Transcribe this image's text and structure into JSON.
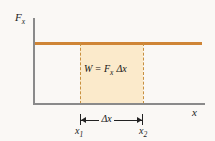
{
  "figure": {
    "axes": {
      "y_label": "F",
      "y_label_sub": "x",
      "x_label": "x"
    },
    "annotations": {
      "equation_w": "W",
      "equation_eq": "=",
      "equation_f": "F",
      "equation_f_sub": "x",
      "equation_delta_x": "Δx",
      "interval_label": "Δx",
      "tick_x1": "x",
      "tick_x1_sub": "1",
      "tick_x2": "x",
      "tick_x2_sub": "2"
    },
    "colors": {
      "force_line": "#cf8536",
      "shaded_region": "#fbeacb",
      "dashed_boundary": "#c8903f",
      "axis": "#8a8a8a",
      "background": "#faf8f5",
      "text": "#151515"
    }
  },
  "chart_data": {
    "type": "area",
    "xlabel": "x",
    "ylabel": "F_x",
    "grid": false,
    "legend": null,
    "xlim": [
      0,
      10
    ],
    "ylim": [
      0,
      10
    ],
    "series": [
      {
        "name": "F_x (constant force)",
        "x": [
          0,
          10
        ],
        "values": [
          7.1,
          7.1
        ],
        "color": "#cf8536"
      }
    ],
    "shaded_area": {
      "label": "W = F_x Δx",
      "x_start": 2.75,
      "x_end": 6.4,
      "y_top": 7.1,
      "y_bottom": 0,
      "color": "#fbeacb"
    },
    "annotations": [
      {
        "text": "W = F_x Δx",
        "x": 4.6,
        "y": 4.5
      },
      {
        "text": "Δx",
        "x": 4.6,
        "y": -0.9
      },
      {
        "text": "x_1",
        "x": 2.75,
        "y": -1.7
      },
      {
        "text": "x_2",
        "x": 6.4,
        "y": -1.7
      }
    ]
  }
}
